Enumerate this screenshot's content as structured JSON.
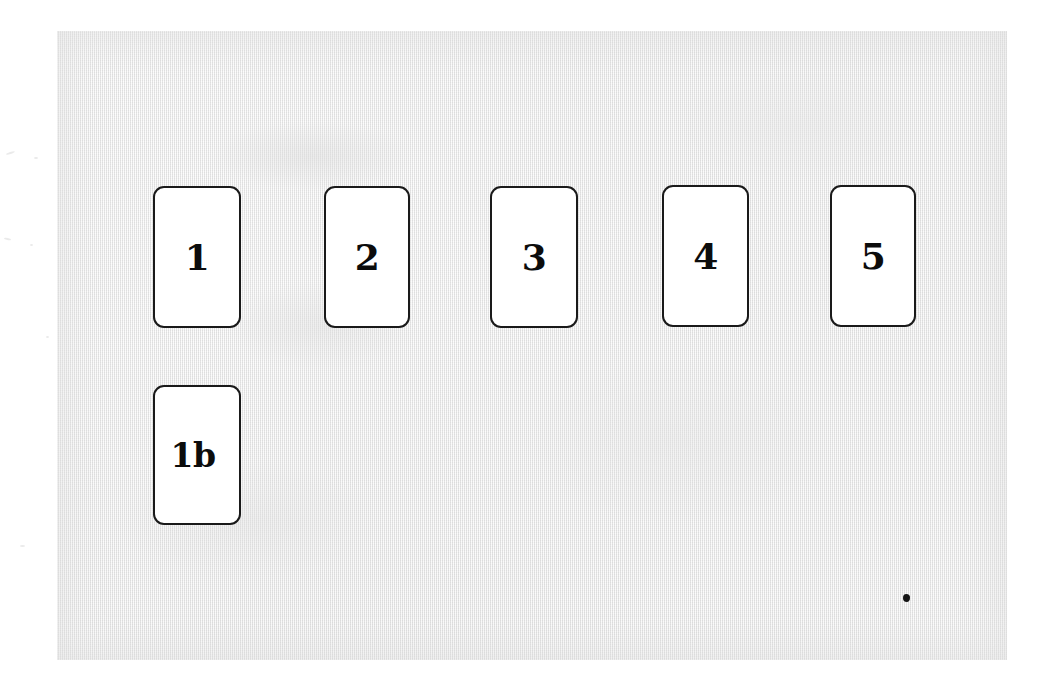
{
  "document": {
    "kind": "scanned-page",
    "background_color": "#ededed",
    "margin_color": "#ffffff",
    "card_fill_color": "#ffffff",
    "card_border_color": "#1a1a1a",
    "label_color": "#0c0c0c"
  },
  "cards": [
    {
      "id": "card-1",
      "label": "1"
    },
    {
      "id": "card-2",
      "label": "2"
    },
    {
      "id": "card-3",
      "label": "3"
    },
    {
      "id": "card-4",
      "label": "4"
    },
    {
      "id": "card-5",
      "label": "5"
    },
    {
      "id": "card-1b",
      "label": "1b"
    }
  ],
  "marks": [
    {
      "id": "ink-speck",
      "label": ""
    }
  ]
}
